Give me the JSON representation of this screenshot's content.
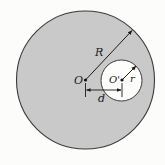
{
  "figure": {
    "labels": {
      "big_center": "O",
      "small_center": "O'",
      "big_radius": "R",
      "small_radius": "r",
      "distance": "d"
    },
    "colors": {
      "background": "#fcfcfa",
      "disk_fill": "#c9c9c9",
      "hole_fill": "#fdfdfb",
      "stroke": "#333333"
    }
  }
}
